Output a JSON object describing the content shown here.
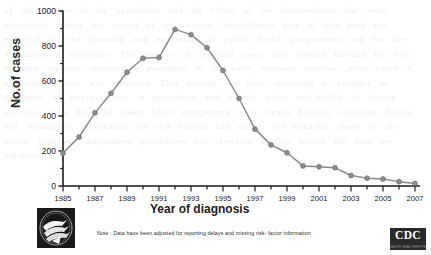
{
  "figure": {
    "note": "Note : Data have been adjusted for reporting delays and missing risk- factor information",
    "hhs_logo_name": "hhs-seal-logo",
    "cdc_logo_text": "CDC",
    "cdc_logo_sub": "SAFER·HEALTHIER·PEOPLE",
    "background_text": "of the disease in the population and the effect of the interventions that were introduced during the period of observation. Surveillance data of this kind are essential for the planning and evaluation of public health programmes and for the allocation of resources. The number of reported cases rose steeply through the late nineteen eighties, reaching a maximum in the early nineteen nineties, after which a sustained decline was observed. This decline has been attributed to changes in treatment, to improvements in prevention and to the wider availability of testing services. Care must be taken when interpreting such trends because reporting delays and incomplete information on risk factors can distort the apparent shape of the curve. Statistical adjustment procedures are therefore applied before the data are published."
  },
  "chart_data": {
    "type": "line",
    "title": "",
    "subtitle": "",
    "xlabel": "Year of diagnosis",
    "ylabel": "No.of cases",
    "xlim": [
      1985,
      2007
    ],
    "ylim": [
      0,
      1000
    ],
    "yticks": [
      0,
      200,
      400,
      600,
      800,
      1000
    ],
    "yticklabels": [
      "0",
      "200",
      "400",
      "600",
      "800",
      "1000"
    ],
    "y_minor_ticks": [
      100,
      300,
      500,
      700,
      900
    ],
    "xticks": [
      1985,
      1986,
      1987,
      1988,
      1989,
      1990,
      1991,
      1992,
      1993,
      1994,
      1995,
      1996,
      1997,
      1998,
      1999,
      2000,
      2001,
      2002,
      2003,
      2004,
      2005,
      2006,
      2007
    ],
    "xticklabels": [
      "1985",
      "",
      "1987",
      "",
      "1989",
      "",
      "1991",
      "",
      "1993",
      "",
      "1995",
      "",
      "1997",
      "",
      "1999",
      "",
      "2001",
      "",
      "2003",
      "",
      "2005",
      "",
      "2007"
    ],
    "grid": false,
    "legend": null,
    "series": [
      {
        "name": "Number of cases",
        "color": "#8c8c8c",
        "marker": "circle",
        "x": [
          1985,
          1986,
          1987,
          1988,
          1989,
          1990,
          1991,
          1992,
          1993,
          1994,
          1995,
          1996,
          1997,
          1998,
          1999,
          2000,
          2001,
          2002,
          2003,
          2004,
          2005,
          2006,
          2007
        ],
        "values": [
          188,
          280,
          418,
          530,
          650,
          730,
          735,
          895,
          865,
          790,
          660,
          500,
          325,
          235,
          190,
          115,
          110,
          105,
          60,
          45,
          40,
          25,
          15
        ]
      }
    ]
  }
}
